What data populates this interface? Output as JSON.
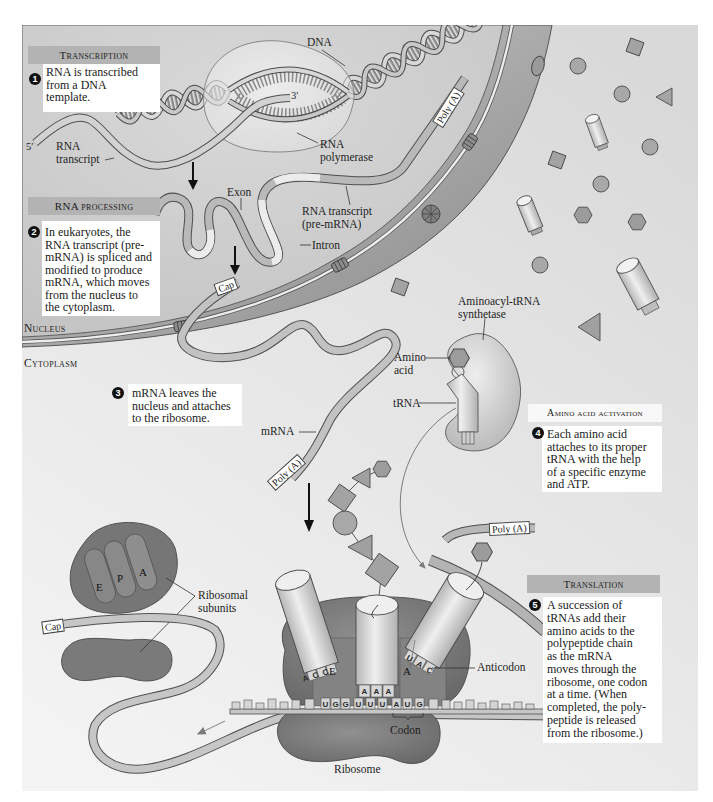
{
  "steps": [
    {
      "number": "1",
      "header": "Transcription",
      "lines": [
        "RNA is transcribed",
        "from a DNA",
        "template."
      ]
    },
    {
      "number": "2",
      "header": "RNA processing",
      "lines": [
        "In eukaryotes, the",
        "RNA transcript (pre-",
        "mRNA) is spliced and",
        "modified to produce",
        "mRNA, which moves",
        "from the nucleus to",
        "the cytoplasm."
      ]
    },
    {
      "number": "3",
      "lines": [
        "mRNA leaves the",
        "nucleus and attaches",
        "to the ribosome."
      ]
    },
    {
      "number": "4",
      "header": "Amino acid activation",
      "lines": [
        "Each amino acid",
        "attaches to its proper",
        "tRNA with the help",
        "of a specific enzyme",
        "and ATP."
      ]
    },
    {
      "number": "5",
      "header": "Translation",
      "lines": [
        "A succession of",
        "tRNAs add their",
        "amino acids to the",
        "polypeptide chain",
        "as the mRNA",
        "moves through the",
        "ribosome, one codon",
        "at a time. (When",
        "completed, the poly-",
        "peptide is released",
        "from the ribosome.)"
      ]
    }
  ],
  "regions": {
    "nucleus": "Nucleus",
    "cytoplasm": "Cytoplasm"
  },
  "labels": {
    "dna": "DNA",
    "three_prime": "3′",
    "five_prime": "5′",
    "rna_transcript": [
      "RNA",
      "transcript"
    ],
    "rna_polymerase": [
      "RNA",
      "polymerase"
    ],
    "poly_a_nucleus": "Poly (A)",
    "exon": "Exon",
    "pre_mrna": [
      "RNA transcript",
      "(pre-mRNA)"
    ],
    "intron": "Intron",
    "cap_nucleus": "Cap",
    "aminoacyl_trna_synthetase": [
      "Aminoacyl-tRNA",
      "synthetase"
    ],
    "amino_acid": [
      "Amino",
      "acid"
    ],
    "trna": "tRNA",
    "mrna": "mRNA",
    "poly_a_cytoplasm": "Poly (A)",
    "poly_a_translation": "Poly (A)",
    "ribosomal_subunits": [
      "Ribosomal",
      "subunits"
    ],
    "subunit_sites": [
      "E",
      "P",
      "A"
    ],
    "cap_cytoplasm": "Cap",
    "ribosome_sites": {
      "e": "E",
      "a": "A"
    },
    "anticodon": "Anticodon",
    "codon": "Codon",
    "ribosome": "Ribosome",
    "mrna_bases": [
      "U",
      "G",
      "G",
      "U",
      "U",
      "U",
      "A",
      "U",
      "G"
    ],
    "p_site_anticodon": [
      "A",
      "A",
      "A"
    ],
    "a_site_anticodon": [
      "U",
      "A",
      "C"
    ],
    "e_site_anticodon": [
      "A",
      "C",
      "C"
    ]
  },
  "colors": {
    "panel_background": "#e6e6e6",
    "nucleoplasm": "#cbcbcb",
    "nuclear_envelope": "#9a9a9a",
    "header_bar": "#b3b3b3",
    "ribosome": "#7a7a7a",
    "text": "#1a1a1a"
  }
}
